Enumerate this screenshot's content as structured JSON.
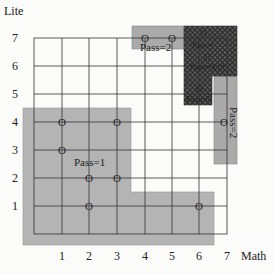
{
  "axes": {
    "x_label": "Math",
    "y_label": "Lite",
    "x_ticks": [
      "1",
      "2",
      "3",
      "4",
      "5",
      "6",
      "7"
    ],
    "y_ticks": [
      "7",
      "6",
      "5",
      "4",
      "3",
      "2",
      "1"
    ]
  },
  "regions": [
    {
      "id": "pass1",
      "label": "Pass=1",
      "fill": "#b4b4b4",
      "points": [
        {
          "x": 1,
          "y": 4,
          "mark": "O"
        },
        {
          "x": 3,
          "y": 4,
          "mark": "O"
        },
        {
          "x": 1,
          "y": 3,
          "mark": "O"
        },
        {
          "x": 2,
          "y": 2,
          "mark": "O"
        },
        {
          "x": 3,
          "y": 2,
          "mark": "O"
        },
        {
          "x": 2,
          "y": 1,
          "mark": "O"
        },
        {
          "x": 6,
          "y": 1,
          "mark": "O"
        }
      ]
    },
    {
      "id": "pass2-top",
      "label": "Pass=2",
      "fill": "#a8a8a8",
      "points": [
        {
          "x": 4,
          "y": 7,
          "mark": "O"
        },
        {
          "x": 5,
          "y": 7,
          "mark": "O"
        }
      ]
    },
    {
      "id": "pass2-right",
      "label": "Pass=2",
      "fill": "#a8a8a8",
      "points": [
        {
          "x": 7,
          "y": 4,
          "mark": "O"
        }
      ]
    },
    {
      "id": "overlap",
      "label": "Pass=3",
      "fill": "#555555",
      "pattern": "crosshatch",
      "points": [
        {
          "x": 6,
          "y": 7,
          "mark": "O"
        },
        {
          "x": 6,
          "y": 6,
          "mark": "O"
        },
        {
          "x": 6,
          "y": 5,
          "mark": "O"
        }
      ]
    }
  ],
  "labels": {
    "pass1": "Pass=1",
    "pass2_top": "Pass=2",
    "pass2_right": "Pass=2",
    "overlap_a": "O",
    "overlap_b": "Pass=",
    "overlap_c": "O",
    "overlap_d": "Pass=3 O",
    "overlap_e": "O",
    "overlap_f": "Pass=3"
  },
  "marks": {
    "p1_1_4": "O",
    "p1_3_4": "O",
    "p1_1_3": "O",
    "p1_2_2": "O",
    "p1_3_2": "O",
    "p1_2_1": "O",
    "p1_6_1": "O",
    "p2_4_7": "O",
    "p2_5_7": "O",
    "p2_7_4": "O"
  }
}
